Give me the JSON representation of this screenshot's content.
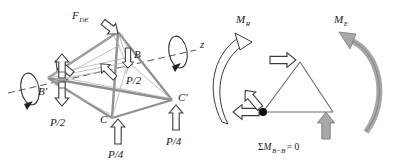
{
  "figure": {
    "title_hidden": "",
    "colors": {
      "edge_gray": "#8a8a8a",
      "edge_dark": "#555555",
      "arrow_outline": "#3a3a3a",
      "arrow_fill": "#ffffff",
      "moment_fill": "#a8a8a8",
      "text": "#1a1a1a",
      "dashed_axis": "#444444",
      "node_dot": "#111111"
    }
  },
  "left_diagram": {
    "name": "tetrahedron-free-body",
    "vertices": [
      {
        "id": "apex",
        "label": "",
        "x": 118,
        "y": 32
      },
      {
        "id": "B",
        "label": "B",
        "x": 128,
        "y": 62
      },
      {
        "id": "Bprime",
        "label": "B'",
        "x": 48,
        "y": 78
      },
      {
        "id": "C",
        "label": "C",
        "x": 112,
        "y": 118
      },
      {
        "id": "Cprime",
        "label": "C'",
        "x": 172,
        "y": 100
      }
    ],
    "forces": [
      {
        "id": "f-de",
        "label": "F",
        "sub": "DE",
        "direction": "down-right"
      },
      {
        "id": "p-half-b",
        "label": "P/2",
        "direction": "down",
        "at": "B"
      },
      {
        "id": "p-half-bprime-up",
        "label": "",
        "direction": "up",
        "at": "B'"
      },
      {
        "id": "p-half-bprime-down",
        "label": "P/2",
        "direction": "down",
        "at": "B'"
      },
      {
        "id": "p-quarter-c",
        "label": "P/4",
        "direction": "up",
        "at": "C"
      },
      {
        "id": "p-quarter-cprime",
        "label": "P/4",
        "direction": "up",
        "at": "C'"
      },
      {
        "id": "reaction-bprime-diag",
        "label": "",
        "direction": "up-left",
        "at": "B'"
      },
      {
        "id": "reaction-apex-diag",
        "label": "",
        "direction": "up-left",
        "at": "apex"
      }
    ],
    "axis": {
      "label": "z",
      "style": "dashed",
      "rotation_indicators": 2
    }
  },
  "right_diagram": {
    "name": "moment-balance-free-body",
    "moment_left": {
      "label": "M",
      "sub": "R",
      "sense": "counterclockwise",
      "style": "outline"
    },
    "moment_right": {
      "label": "M",
      "sub": "E",
      "sense": "counterclockwise",
      "style": "filled"
    },
    "equation": {
      "sigma": "Σ",
      "m": "M",
      "sub": "B−B",
      "rhs": "= 0",
      "full": "ΣM B−B = 0"
    },
    "arrows": [
      {
        "id": "top-push-right",
        "direction": "right",
        "style": "outline"
      },
      {
        "id": "pivot-push-left",
        "direction": "left",
        "style": "outline"
      },
      {
        "id": "pivot-push-upleft",
        "direction": "up-left",
        "style": "outline"
      },
      {
        "id": "support-up",
        "direction": "up",
        "style": "filled"
      }
    ],
    "pivot": {
      "id": "pivot-node",
      "shape": "filled-circle"
    }
  }
}
